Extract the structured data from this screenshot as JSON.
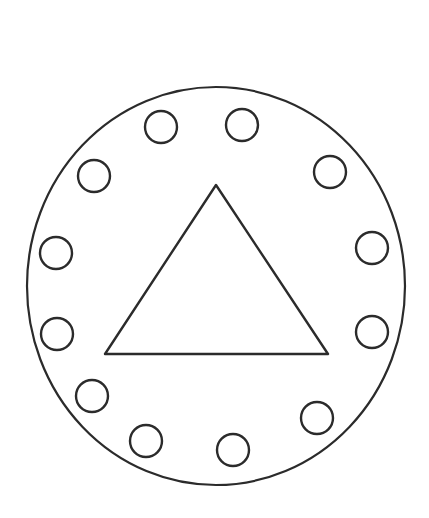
{
  "canvas": {
    "width": 429,
    "height": 518,
    "background_color": "#ffffff",
    "title": "Circular line drawing with triangle and ring of twelve circles"
  },
  "style": {
    "stroke_color": "#2b2b2b",
    "fill_color": "none",
    "outer_circle_stroke_width": 2.2,
    "triangle_stroke_width": 2.4,
    "small_circle_stroke_width": 2.4,
    "line_cap": "round",
    "line_join": "round"
  },
  "shapes": {
    "outer_circle": {
      "name": "outer-circle",
      "type": "ellipse",
      "cx": 216,
      "cy": 286,
      "rx": 189,
      "ry": 199
    },
    "triangle": {
      "name": "center-triangle",
      "type": "polygon",
      "points": "216,185 328,354 105,354",
      "apex_x": 216,
      "apex_y": 185,
      "base_left_x": 105,
      "base_left_y": 354,
      "base_right_x": 328,
      "base_right_y": 354
    },
    "small_circles": {
      "name": "ring-of-circles",
      "count": 12,
      "radius": 16,
      "items": [
        {
          "index": 1,
          "label": "ring-circle-1",
          "cx": 161,
          "cy": 127
        },
        {
          "index": 2,
          "label": "ring-circle-2",
          "cx": 242,
          "cy": 125
        },
        {
          "index": 3,
          "label": "ring-circle-3",
          "cx": 330,
          "cy": 172
        },
        {
          "index": 4,
          "label": "ring-circle-4",
          "cx": 372,
          "cy": 248
        },
        {
          "index": 5,
          "label": "ring-circle-5",
          "cx": 372,
          "cy": 332
        },
        {
          "index": 6,
          "label": "ring-circle-6",
          "cx": 317,
          "cy": 418
        },
        {
          "index": 7,
          "label": "ring-circle-7",
          "cx": 233,
          "cy": 450
        },
        {
          "index": 8,
          "label": "ring-circle-8",
          "cx": 146,
          "cy": 441
        },
        {
          "index": 9,
          "label": "ring-circle-9",
          "cx": 92,
          "cy": 396
        },
        {
          "index": 10,
          "label": "ring-circle-10",
          "cx": 57,
          "cy": 334
        },
        {
          "index": 11,
          "label": "ring-circle-11",
          "cx": 56,
          "cy": 253
        },
        {
          "index": 12,
          "label": "ring-circle-12",
          "cx": 94,
          "cy": 176
        }
      ]
    }
  }
}
